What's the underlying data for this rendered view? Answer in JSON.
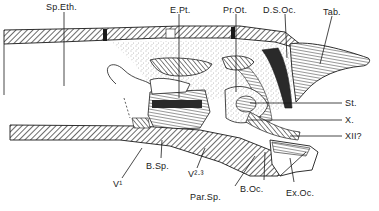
{
  "figure": {
    "type": "anatomical-section-drawing",
    "colors": {
      "ink": "#1a1a1a",
      "paper": "#ffffff",
      "stipple": "#6b6b6b"
    }
  },
  "labels": {
    "sp_eth": "Sp.Eth.",
    "e_pt": "E.Pt.",
    "pr_ot": "Pr.Ot.",
    "d_s_oc": "D.S.Oc.",
    "tab": "Tab.",
    "st": "St.",
    "x": "X.",
    "xii": "XII?",
    "v1": "V¹",
    "b_sp": "B.Sp.",
    "v23": "V²·³",
    "par_sp": "Par.Sp.",
    "b_oc": "B.Oc.",
    "ex_oc": "Ex.Oc."
  }
}
